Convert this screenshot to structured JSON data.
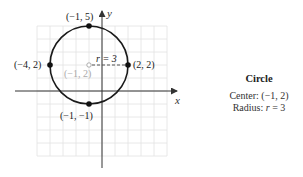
{
  "figure": {
    "grid": {
      "x_min_px": 37,
      "x_max_px": 167,
      "y_min_px": 26,
      "y_max_px": 156,
      "step_px": 13,
      "color": "#e2e2e2"
    },
    "origin_px": {
      "x": 102,
      "y": 91
    },
    "unit_px": 13,
    "axes": {
      "x_label": "x",
      "y_label": "y",
      "color": "#333333"
    },
    "circle": {
      "center": [
        -1,
        2
      ],
      "radius": 3,
      "stroke": "#1a1a1a"
    },
    "points": [
      {
        "label": "(−1, 5)",
        "coords": [
          -1,
          5
        ]
      },
      {
        "label": "(−4, 2)",
        "coords": [
          -4,
          2
        ]
      },
      {
        "label": "(2, 2)",
        "coords": [
          2,
          2
        ]
      },
      {
        "label": "(−1, −1)",
        "coords": [
          -1,
          -1
        ]
      }
    ],
    "center_label": "(−1, 2)",
    "radius_label": "r = 3"
  },
  "caption": {
    "title": "Circle",
    "center_prefix": "Center: ",
    "center_value": "(−1, 2)",
    "radius_prefix": "Radius: ",
    "radius_var": "r",
    "radius_value": " = 3"
  }
}
